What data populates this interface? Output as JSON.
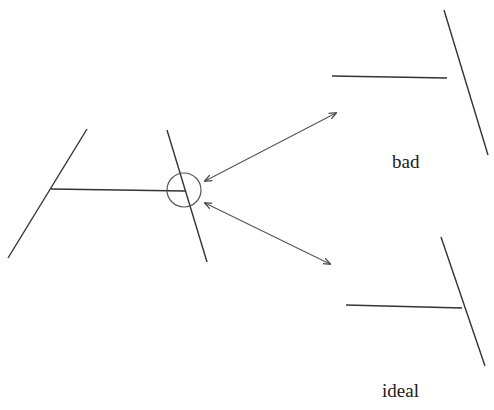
{
  "diagram": {
    "labels": {
      "bad": "bad",
      "ideal": "ideal"
    },
    "colors": {
      "stroke": "#333333",
      "arrow": "#555555",
      "background": "#ffffff"
    },
    "source_figure": {
      "left_line": [
        [
          87,
          129
        ],
        [
          8,
          258
        ]
      ],
      "right_line": [
        [
          167,
          130
        ],
        [
          207,
          262
        ]
      ],
      "connector": [
        [
          51,
          189
        ],
        [
          185,
          191
        ]
      ],
      "highlight_circle": {
        "cx": 184,
        "cy": 190,
        "r": 17
      }
    },
    "bad_figure": {
      "connector": [
        [
          332,
          76
        ],
        [
          447,
          78
        ]
      ],
      "slanted_line": [
        [
          444,
          10
        ],
        [
          488,
          155
        ]
      ]
    },
    "ideal_figure": {
      "connector": [
        [
          346,
          305
        ],
        [
          462,
          308
        ]
      ],
      "slanted_line": [
        [
          441,
          237
        ],
        [
          485,
          366
        ]
      ]
    },
    "arrows": [
      {
        "name": "to-bad",
        "from": [
          205,
          181
        ],
        "to": [
          336,
          113
        ]
      },
      {
        "name": "to-ideal",
        "from": [
          205,
          203
        ],
        "to": [
          330,
          264
        ]
      }
    ]
  }
}
